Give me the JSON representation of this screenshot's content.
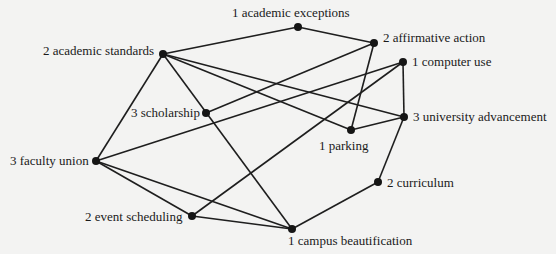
{
  "diagram": {
    "type": "undirected-network-graph",
    "nodes": [
      {
        "id": "academic_exceptions",
        "label": "1 academic exceptions",
        "x": 298,
        "y": 27,
        "lx": 232,
        "ly": 6,
        "anchor": "above"
      },
      {
        "id": "affirmative_action",
        "label": "2 affirmative action",
        "x": 374,
        "y": 43,
        "lx": 383,
        "ly": 31,
        "anchor": "right"
      },
      {
        "id": "academic_standards",
        "label": "2 academic standards",
        "x": 163,
        "y": 54,
        "lx": 43,
        "ly": 44,
        "anchor": "left"
      },
      {
        "id": "computer_use",
        "label": "1 computer use",
        "x": 403,
        "y": 62,
        "lx": 412,
        "ly": 55,
        "anchor": "right"
      },
      {
        "id": "scholarship",
        "label": "3 scholarship",
        "x": 206,
        "y": 113,
        "lx": 131,
        "ly": 106,
        "anchor": "left"
      },
      {
        "id": "university_advancement",
        "label": "3 university advancement",
        "x": 404,
        "y": 117,
        "lx": 413,
        "ly": 110,
        "anchor": "right"
      },
      {
        "id": "parking",
        "label": "1 parking",
        "x": 351,
        "y": 130,
        "lx": 319,
        "ly": 139,
        "anchor": "below"
      },
      {
        "id": "faculty_union",
        "label": "3 faculty union",
        "x": 96,
        "y": 161,
        "lx": 10,
        "ly": 154,
        "anchor": "left"
      },
      {
        "id": "curriculum",
        "label": "2 curriculum",
        "x": 378,
        "y": 182,
        "lx": 387,
        "ly": 176,
        "anchor": "right"
      },
      {
        "id": "event_scheduling",
        "label": "2 event scheduling",
        "x": 192,
        "y": 216,
        "lx": 85,
        "ly": 210,
        "anchor": "left"
      },
      {
        "id": "campus_beautification",
        "label": "1 campus beautification",
        "x": 292,
        "y": 229,
        "lx": 288,
        "ly": 234,
        "anchor": "below"
      }
    ],
    "edges": [
      [
        "academic_standards",
        "academic_exceptions"
      ],
      [
        "academic_exceptions",
        "affirmative_action"
      ],
      [
        "academic_standards",
        "university_advancement"
      ],
      [
        "academic_standards",
        "parking"
      ],
      [
        "academic_standards",
        "faculty_union"
      ],
      [
        "academic_standards",
        "campus_beautification"
      ],
      [
        "scholarship",
        "affirmative_action"
      ],
      [
        "affirmative_action",
        "parking"
      ],
      [
        "faculty_union",
        "computer_use"
      ],
      [
        "computer_use",
        "event_scheduling"
      ],
      [
        "computer_use",
        "university_advancement"
      ],
      [
        "parking",
        "university_advancement"
      ],
      [
        "university_advancement",
        "curriculum"
      ],
      [
        "curriculum",
        "campus_beautification"
      ],
      [
        "faculty_union",
        "event_scheduling"
      ],
      [
        "faculty_union",
        "campus_beautification"
      ],
      [
        "event_scheduling",
        "campus_beautification"
      ]
    ],
    "colors": {
      "edge": "#1e1e1e",
      "node": "#151515",
      "background": "#f3f3f2",
      "text": "#1a1a1a"
    }
  }
}
